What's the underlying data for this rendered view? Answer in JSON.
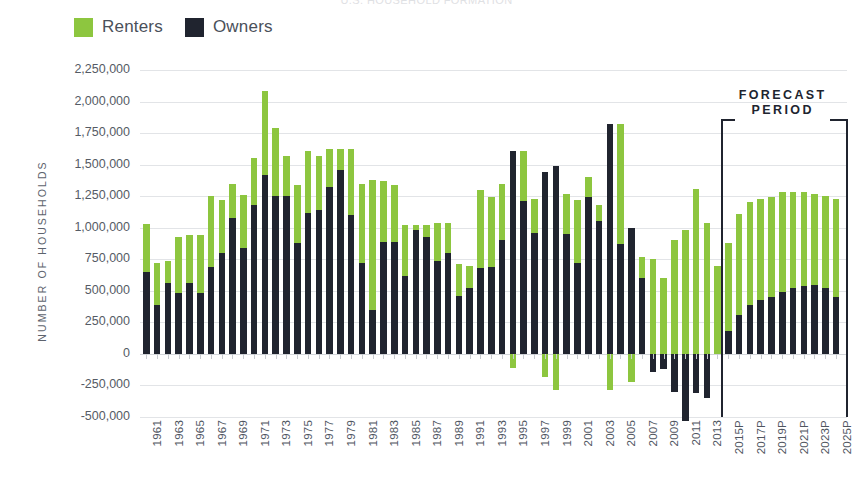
{
  "title": "U.S. HOUSEHOLD FORMATION",
  "legend": {
    "position": "top-left",
    "items": [
      {
        "label": "Renters",
        "color": "#8dc63f",
        "key": "renters"
      },
      {
        "label": "Owners",
        "color": "#20242f",
        "key": "owners"
      }
    ]
  },
  "annotations": [
    {
      "name": "forecast-period",
      "line1": "FORECAST",
      "line2": "PERIOD",
      "start_category": "2015P",
      "end_category": "2025P"
    }
  ],
  "chart_data": {
    "type": "bar",
    "stacked": true,
    "title": "U.S. HOUSEHOLD FORMATION",
    "xlabel": "",
    "ylabel": "NUMBER OF HOUSEHOLDS",
    "ylim": [
      -500000,
      2250000
    ],
    "ytick_step": 250000,
    "yticks": [
      2250000,
      2000000,
      1750000,
      1500000,
      1250000,
      1000000,
      750000,
      500000,
      250000,
      0,
      -250000,
      -500000
    ],
    "ytick_labels": [
      "2,250,000",
      "2,000,000",
      "1,750,000",
      "1,500,000",
      "1,250,000",
      "1,000,000",
      "750,000",
      "500,000",
      "250,000",
      "0",
      "-250,000",
      "-500,000"
    ],
    "grid": true,
    "legend_position": "top-left",
    "xtick_labels_every": 2,
    "categories": [
      "1961",
      "1962",
      "1963",
      "1964",
      "1965",
      "1966",
      "1967",
      "1968",
      "1969",
      "1970",
      "1971",
      "1972",
      "1973",
      "1974",
      "1975",
      "1976",
      "1977",
      "1978",
      "1979",
      "1980",
      "1981",
      "1982",
      "1983",
      "1984",
      "1985",
      "1986",
      "1987",
      "1988",
      "1989",
      "1990",
      "1991",
      "1992",
      "1993",
      "1994",
      "1995",
      "1996",
      "1997",
      "1998",
      "1999",
      "2000",
      "2001",
      "2002",
      "2003",
      "2004",
      "2005",
      "2006",
      "2007",
      "2008",
      "2009",
      "2010",
      "2011",
      "2012",
      "2013",
      "2014",
      "2015P",
      "2016P",
      "2017P",
      "2018P",
      "2019P",
      "2020P",
      "2021P",
      "2022P",
      "2023P",
      "2024P",
      "2025P"
    ],
    "series": [
      {
        "name": "Owners",
        "color": "#20242f",
        "values": [
          650000,
          390000,
          560000,
          480000,
          560000,
          480000,
          690000,
          800000,
          1080000,
          840000,
          1180000,
          1420000,
          1250000,
          1250000,
          880000,
          1120000,
          1140000,
          1320000,
          1460000,
          1100000,
          720000,
          350000,
          890000,
          890000,
          620000,
          980000,
          930000,
          740000,
          800000,
          460000,
          520000,
          680000,
          690000,
          900000,
          1610000,
          1210000,
          960000,
          1440000,
          1490000,
          950000,
          720000,
          1240000,
          1050000,
          1820000,
          870000,
          1000000,
          600000,
          -140000,
          -120000,
          -300000,
          -530000,
          -310000,
          -350000,
          0,
          180000,
          310000,
          390000,
          430000,
          450000,
          490000,
          520000,
          540000,
          550000,
          520000,
          450000
        ]
      },
      {
        "name": "Renters",
        "color": "#8dc63f",
        "values": [
          380000,
          330000,
          180000,
          450000,
          380000,
          460000,
          560000,
          420000,
          270000,
          420000,
          370000,
          660000,
          540000,
          320000,
          460000,
          490000,
          430000,
          300000,
          160000,
          520000,
          630000,
          1030000,
          480000,
          450000,
          400000,
          40000,
          90000,
          300000,
          240000,
          250000,
          180000,
          620000,
          550000,
          450000,
          -110000,
          400000,
          270000,
          -180000,
          -290000,
          320000,
          500000,
          160000,
          130000,
          -290000,
          950000,
          -220000,
          170000,
          750000,
          600000,
          900000,
          980000,
          1310000,
          1040000,
          700000,
          700000,
          800000,
          810000,
          800000,
          790000,
          790000,
          760000,
          740000,
          720000,
          730000,
          780000
        ]
      }
    ]
  }
}
